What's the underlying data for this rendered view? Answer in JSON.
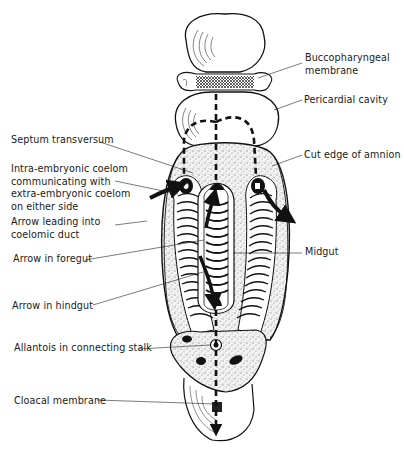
{
  "figure": {
    "type": "embryology-diagram",
    "ink_color": "#111111",
    "background": "#ffffff"
  },
  "labels": {
    "buccopharyngeal_1": "Buccopharyngeal",
    "buccopharyngeal_2": "membrane",
    "pericardial_cavity": "Pericardial cavity",
    "septum_transversum": "Septum transversum",
    "cut_edge_amnion": "Cut edge of amnion",
    "intra_coelom_1": "Intra-embryonic coelom",
    "intra_coelom_2": "communicating with",
    "intra_coelom_3": "extra-embryonic coelom",
    "intra_coelom_4": "on either side",
    "arrow_coelomic_1": "Arrow leading into",
    "arrow_coelomic_2": "coelomic duct",
    "arrow_foregut": "Arrow in foregut",
    "midgut": "Midgut",
    "arrow_hindgut": "Arrow in hindgut",
    "allantois": "Allantois in connecting stalk",
    "cloacal_membrane": "Cloacal membrane"
  }
}
